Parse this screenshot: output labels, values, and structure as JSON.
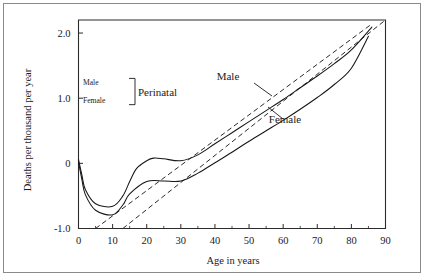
{
  "figure": {
    "background_color": "#ffffff",
    "frame_color": "#8a8a8a",
    "ink_color": "#161616"
  },
  "chart_data": {
    "type": "line",
    "title": "",
    "xlabel": "Age in years",
    "ylabel": "Deaths per thousand per year",
    "xlim": [
      0,
      90
    ],
    "ylim": [
      -1.0,
      2.2
    ],
    "xticks": [
      0,
      10,
      20,
      30,
      40,
      50,
      60,
      70,
      80,
      90
    ],
    "xtick_labels": [
      "0",
      "10",
      "20",
      "30",
      "40",
      "50",
      "60",
      "70",
      "80",
      "90"
    ],
    "xminor_ticks": [
      5,
      15,
      25,
      35,
      45,
      55,
      65,
      75,
      85
    ],
    "yticks": [
      -1.0,
      0,
      1.0,
      2.0
    ],
    "ytick_labels": [
      "-1.0",
      "0",
      "1.0",
      "2.0"
    ],
    "grid": false,
    "legend_position": "inline-labels",
    "series": [
      {
        "name": "Male",
        "label": "Male",
        "marker": "diamond",
        "style": "solid",
        "x": [
          0,
          1,
          2,
          5,
          10,
          13,
          15,
          17,
          20,
          22,
          25,
          30,
          35,
          40,
          45,
          50,
          55,
          60,
          65,
          70,
          75,
          80,
          86
        ],
        "y": [
          0.06,
          -0.18,
          -0.4,
          -0.62,
          -0.66,
          -0.5,
          -0.28,
          -0.08,
          0.04,
          0.08,
          0.07,
          0.04,
          0.13,
          0.3,
          0.47,
          0.64,
          0.81,
          0.98,
          1.16,
          1.34,
          1.53,
          1.74,
          2.09
        ]
      },
      {
        "name": "Female",
        "label": "Female",
        "marker": "diamond",
        "style": "solid",
        "x": [
          0,
          1,
          2,
          5,
          10,
          13,
          15,
          20,
          25,
          30,
          35,
          40,
          45,
          50,
          55,
          60,
          65,
          70,
          75,
          80,
          85
        ],
        "y": [
          0.02,
          -0.25,
          -0.48,
          -0.72,
          -0.79,
          -0.64,
          -0.47,
          -0.28,
          -0.27,
          -0.27,
          -0.15,
          0.01,
          0.17,
          0.34,
          0.5,
          0.66,
          0.83,
          1.01,
          1.21,
          1.46,
          1.95
        ]
      },
      {
        "name": "Male asymptote",
        "label": "",
        "marker": "none",
        "style": "dashed",
        "x": [
          5,
          86
        ],
        "y": [
          -1.0,
          2.14
        ]
      },
      {
        "name": "Female asymptote",
        "label": "",
        "marker": "none",
        "style": "dashed",
        "x": [
          13,
          90
        ],
        "y": [
          -1.0,
          2.2
        ]
      }
    ],
    "annotations": [
      {
        "name": "male-curve-label",
        "text": "Male",
        "x_px": 228,
        "y_px": 80,
        "leader_from_px": [
          254,
          83
        ],
        "leader_to_px": [
          272,
          96
        ]
      },
      {
        "name": "female-curve-label",
        "text": "Female",
        "x_px": 285,
        "y_px": 123,
        "leader_from_px": [
          283,
          119
        ],
        "leader_to_px": [
          268,
          107
        ]
      }
    ],
    "key": {
      "title": "Perinatal",
      "entries": [
        {
          "label": "Male",
          "value_y": 1.25
        },
        {
          "label": "Female",
          "value_y": 0.97
        }
      ]
    }
  }
}
